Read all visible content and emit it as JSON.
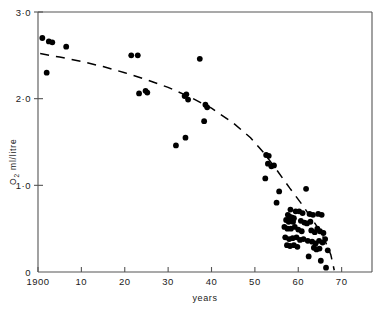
{
  "chart_data": {
    "type": "scatter",
    "title": "",
    "xlabel": "years",
    "ylabel": "O2 ml/litre",
    "ylabel_parts": {
      "main": "O",
      "sub": "2",
      "rest": " ml/litre"
    },
    "xlim": [
      1900,
      1977
    ],
    "ylim": [
      0,
      3.0
    ],
    "grid": false,
    "legend": null,
    "x_ticks": [
      1900,
      1910,
      1920,
      1930,
      1940,
      1950,
      1960,
      1970
    ],
    "x_tick_labels": [
      "1900",
      "10",
      "20",
      "30",
      "40",
      "50",
      "60",
      "70"
    ],
    "y_ticks": [
      0,
      1.0,
      2.0,
      3.0
    ],
    "y_tick_labels": [
      "0",
      "1·0",
      "2·0",
      "3·0"
    ],
    "marker": "filled-circle",
    "marker_color": "#000000",
    "trend_line": {
      "style": "dashed",
      "color": "#000000",
      "description": "hand-drawn dashed declining curve",
      "points": [
        [
          1900.5,
          2.52
        ],
        [
          1905,
          2.48
        ],
        [
          1910,
          2.43
        ],
        [
          1915,
          2.37
        ],
        [
          1920,
          2.3
        ],
        [
          1925,
          2.22
        ],
        [
          1930,
          2.13
        ],
        [
          1935,
          2.02
        ],
        [
          1940,
          1.89
        ],
        [
          1945,
          1.72
        ],
        [
          1949,
          1.55
        ],
        [
          1952,
          1.38
        ],
        [
          1955,
          1.18
        ],
        [
          1958,
          0.97
        ],
        [
          1961,
          0.77
        ],
        [
          1964,
          0.55
        ],
        [
          1966,
          0.38
        ],
        [
          1967.5,
          0.2
        ],
        [
          1968.3,
          0.02
        ]
      ]
    },
    "points": [
      [
        1901.0,
        2.7
      ],
      [
        1902.5,
        2.66
      ],
      [
        1903.3,
        2.65
      ],
      [
        1906.5,
        2.6
      ],
      [
        1902.0,
        2.3
      ],
      [
        1921.5,
        2.5
      ],
      [
        1923.0,
        2.5
      ],
      [
        1937.3,
        2.46
      ],
      [
        1923.3,
        2.06
      ],
      [
        1924.8,
        2.09
      ],
      [
        1925.2,
        2.07
      ],
      [
        1933.8,
        2.03
      ],
      [
        1934.2,
        2.05
      ],
      [
        1934.6,
        1.99
      ],
      [
        1938.6,
        1.93
      ],
      [
        1939.0,
        1.9
      ],
      [
        1938.3,
        1.74
      ],
      [
        1934.0,
        1.55
      ],
      [
        1931.8,
        1.46
      ],
      [
        1952.6,
        1.35
      ],
      [
        1953.2,
        1.34
      ],
      [
        1953.0,
        1.25
      ],
      [
        1953.8,
        1.22
      ],
      [
        1954.4,
        1.23
      ],
      [
        1952.4,
        1.08
      ],
      [
        1955.6,
        0.93
      ],
      [
        1961.8,
        0.96
      ],
      [
        1955.0,
        0.8
      ],
      [
        1958.2,
        0.72
      ],
      [
        1959.4,
        0.7
      ],
      [
        1960.2,
        0.7
      ],
      [
        1961.0,
        0.68
      ],
      [
        1957.6,
        0.66
      ],
      [
        1958.0,
        0.64
      ],
      [
        1958.5,
        0.63
      ],
      [
        1959.0,
        0.62
      ],
      [
        1962.6,
        0.67
      ],
      [
        1963.4,
        0.66
      ],
      [
        1964.6,
        0.67
      ],
      [
        1965.4,
        0.66
      ],
      [
        1957.2,
        0.6
      ],
      [
        1957.8,
        0.58
      ],
      [
        1958.8,
        0.58
      ],
      [
        1960.6,
        0.59
      ],
      [
        1961.4,
        0.57
      ],
      [
        1962.0,
        0.56
      ],
      [
        1962.8,
        0.58
      ],
      [
        1956.8,
        0.52
      ],
      [
        1957.5,
        0.5
      ],
      [
        1958.3,
        0.5
      ],
      [
        1959.2,
        0.52
      ],
      [
        1960.0,
        0.49
      ],
      [
        1960.8,
        0.47
      ],
      [
        1963.0,
        0.48
      ],
      [
        1963.8,
        0.46
      ],
      [
        1964.4,
        0.5
      ],
      [
        1965.0,
        0.47
      ],
      [
        1965.8,
        0.45
      ],
      [
        1957.0,
        0.4
      ],
      [
        1957.9,
        0.38
      ],
      [
        1958.7,
        0.39
      ],
      [
        1959.6,
        0.4
      ],
      [
        1960.4,
        0.37
      ],
      [
        1961.2,
        0.38
      ],
      [
        1962.2,
        0.36
      ],
      [
        1963.2,
        0.35
      ],
      [
        1964.0,
        0.33
      ],
      [
        1964.8,
        0.36
      ],
      [
        1965.6,
        0.34
      ],
      [
        1966.2,
        0.38
      ],
      [
        1957.4,
        0.31
      ],
      [
        1958.1,
        0.3
      ],
      [
        1959.0,
        0.31
      ],
      [
        1959.8,
        0.29
      ],
      [
        1963.6,
        0.28
      ],
      [
        1964.2,
        0.26
      ],
      [
        1964.9,
        0.27
      ],
      [
        1966.8,
        0.25
      ],
      [
        1962.4,
        0.18
      ],
      [
        1965.2,
        0.13
      ],
      [
        1966.4,
        0.05
      ]
    ]
  },
  "plot_frame": {
    "left_px": 38,
    "right_px": 372,
    "top_px": 12,
    "bottom_px": 272,
    "border_color": "#555555"
  }
}
